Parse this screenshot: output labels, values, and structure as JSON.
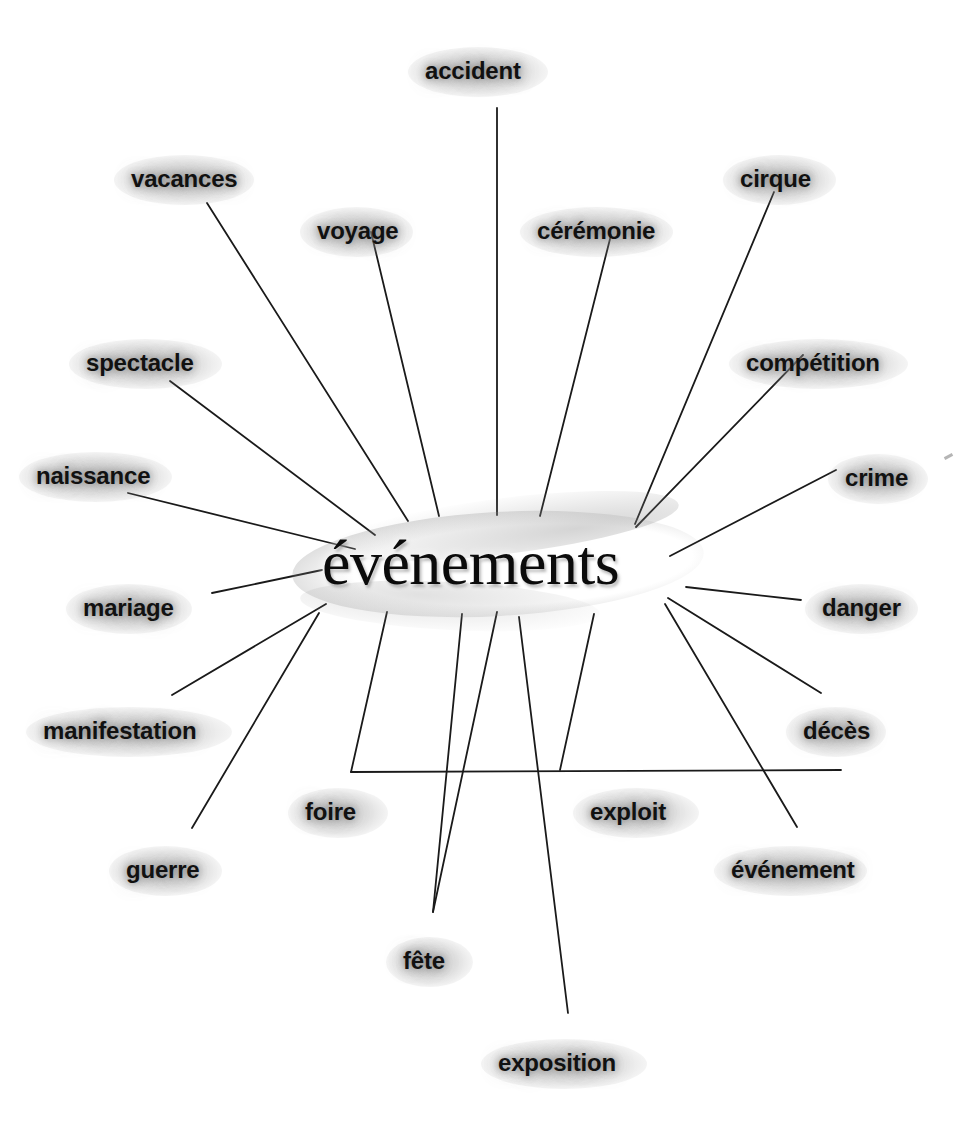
{
  "diagram": {
    "type": "radial-word-association",
    "title": "événements",
    "hub": {
      "label": "événements",
      "cx": 497,
      "cy": 573
    },
    "style": {
      "background": "#ffffff",
      "text_color": "#111111",
      "hub_text_color": "#0b0b0b",
      "line_color": "#1a1a1a",
      "halo_color": "#8c8c8c"
    },
    "nodes": [
      {
        "label": "accident",
        "lx": 425,
        "ly": 58,
        "line": [
          497,
          108,
          497,
          515
        ]
      },
      {
        "label": "vacances",
        "lx": 131,
        "ly": 166,
        "line": [
          207,
          203,
          408,
          521
        ]
      },
      {
        "label": "voyage",
        "lx": 317,
        "ly": 218,
        "line": [
          371,
          232,
          439,
          516
        ]
      },
      {
        "label": "cirque",
        "lx": 740,
        "ly": 166,
        "line": [
          774,
          192,
          635,
          524
        ]
      },
      {
        "label": "cérémonie",
        "lx": 537,
        "ly": 218,
        "line": [
          611,
          235,
          540,
          516
        ]
      },
      {
        "label": "compétition",
        "lx": 746,
        "ly": 350,
        "line": [
          803,
          355,
          636,
          527
        ]
      },
      {
        "label": "spectacle",
        "lx": 86,
        "ly": 350,
        "line": [
          170,
          381,
          375,
          535
        ]
      },
      {
        "label": "crime",
        "lx": 845,
        "ly": 465,
        "line": [
          836,
          470,
          670,
          556
        ]
      },
      {
        "label": "naissance",
        "lx": 36,
        "ly": 463,
        "line": [
          128,
          493,
          355,
          549
        ]
      },
      {
        "label": "mariage",
        "lx": 83,
        "ly": 595,
        "line": [
          212,
          593,
          322,
          570
        ]
      },
      {
        "label": "danger",
        "lx": 822,
        "ly": 595,
        "line": [
          686,
          587,
          801,
          600
        ]
      },
      {
        "label": "manifestation",
        "lx": 43,
        "ly": 718,
        "line": [
          172,
          695,
          326,
          604
        ]
      },
      {
        "label": "décès",
        "lx": 803,
        "ly": 718,
        "line": [
          821,
          693,
          668,
          598
        ]
      },
      {
        "label": "guerre",
        "lx": 126,
        "ly": 857,
        "line": [
          192,
          828,
          319,
          613
        ]
      },
      {
        "label": "foire",
        "lx": 305,
        "ly": 799,
        "line": [
          351,
          772,
          841,
          770
        ]
      },
      {
        "label": "exploit",
        "lx": 590,
        "ly": 799,
        "line": [
          560,
          770,
          594,
          614
        ]
      },
      {
        "label": "événement",
        "lx": 731,
        "ly": 857,
        "line": [
          797,
          827,
          665,
          604
        ]
      },
      {
        "label": "fête",
        "lx": 403,
        "ly": 948,
        "line": [
          433,
          912,
          952,
          951
        ]
      },
      {
        "label": "exposition",
        "lx": 498,
        "ly": 1050,
        "line": [
          568,
          1013,
          519,
          617
        ]
      }
    ],
    "extra_nodes": [
      {
        "label": "foire",
        "spoke_from": [
          351,
          772
        ],
        "spoke_to": [
          387,
          612
        ]
      },
      {
        "label": "fête",
        "spoke_from": [
          433,
          912
        ],
        "spoke_to": [
          462,
          614
        ]
      }
    ],
    "artifact": {
      "name": "scan-speck",
      "x": 944,
      "y": 455
    }
  }
}
